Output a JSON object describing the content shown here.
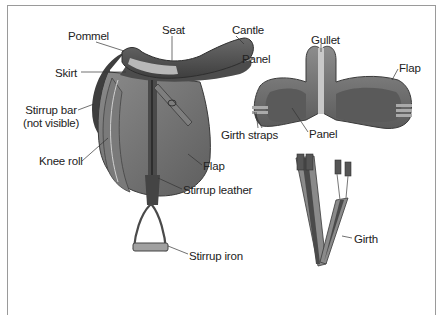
{
  "diagram": {
    "frame_color": "#9a9a9a",
    "colors": {
      "leather_dark": "#4a4a4a",
      "leather_mid": "#6f6f6f",
      "leather_light": "#9c9c9c",
      "highlight": "#c8c8c8",
      "label_text": "#222222"
    },
    "figures": [
      {
        "name": "saddle-side-view",
        "labels": [
          "Pommel",
          "Seat",
          "Cantle",
          "Skirt",
          "Panel",
          "Stirrup bar (not visible)",
          "Knee roll",
          "Flap",
          "Stirrup leather",
          "Stirrup iron"
        ]
      },
      {
        "name": "saddle-underside-view",
        "labels": [
          "Gullet",
          "Flap",
          "Girth straps",
          "Panel"
        ]
      },
      {
        "name": "girth",
        "labels": [
          "Girth"
        ]
      }
    ],
    "labels": {
      "pommel": "Pommel",
      "seat": "Seat",
      "cantle": "Cantle",
      "skirt": "Skirt",
      "panel_side": "Panel",
      "stirrup_bar_line1": "Stirrup bar",
      "stirrup_bar_line2": "(not visible)",
      "knee_roll": "Knee roll",
      "flap_side": "Flap",
      "stirrup_leather": "Stirrup leather",
      "stirrup_iron": "Stirrup iron",
      "gullet": "Gullet",
      "flap_under": "Flap",
      "girth_straps": "Girth straps",
      "panel_under": "Panel",
      "girth": "Girth"
    }
  }
}
